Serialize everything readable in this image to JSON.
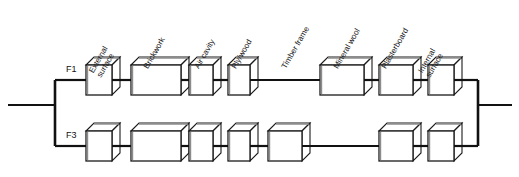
{
  "diagram": {
    "type": "thermal-resistance-network",
    "title": "",
    "background_color": "#ffffff",
    "line_color": "#111111",
    "box_face_color": "#ffffff",
    "box_edge_color": "#1a1a1a",
    "box_shade_color": "#8c8c8c",
    "layer_labels": [
      {
        "name": "external-surface",
        "text": "External\nsurface",
        "x": 103,
        "y": 62
      },
      {
        "name": "brickwork",
        "text": "Brickwork",
        "x": 150,
        "y": 62
      },
      {
        "name": "air-cavity",
        "text": "Air cavity",
        "x": 201,
        "y": 62
      },
      {
        "name": "ply-wood",
        "text": "Ply/wood",
        "x": 238,
        "y": 62
      },
      {
        "name": "timber-frame",
        "text": "Timber frame",
        "x": 288,
        "y": 62
      },
      {
        "name": "mineral-wool",
        "text": "Mineral wool",
        "x": 340,
        "y": 62
      },
      {
        "name": "plasterboard",
        "text": "Plasterboard",
        "x": 388,
        "y": 62
      },
      {
        "name": "internal-surface",
        "text": "Internal\nsurface",
        "x": 432,
        "y": 62
      }
    ],
    "paths": [
      {
        "id": "F1",
        "label": "F1",
        "label_x": 66,
        "label_y": 64,
        "wire_y": 80,
        "elements": [
          {
            "kind": "box",
            "layer": "external-surface",
            "x": 86,
            "w": 26
          },
          {
            "kind": "box",
            "layer": "brickwork",
            "x": 131,
            "w": 50
          },
          {
            "kind": "box",
            "layer": "air-cavity",
            "x": 189,
            "w": 24
          },
          {
            "kind": "box",
            "layer": "ply-wood",
            "x": 228,
            "w": 22
          },
          {
            "kind": "wire",
            "layer": "timber-frame",
            "x": 250,
            "w": 70
          },
          {
            "kind": "box",
            "layer": "mineral-wool",
            "x": 320,
            "w": 44
          },
          {
            "kind": "box",
            "layer": "plasterboard",
            "x": 379,
            "w": 34
          },
          {
            "kind": "box",
            "layer": "internal-surface",
            "x": 428,
            "w": 26
          }
        ]
      },
      {
        "id": "F3",
        "label": "F3",
        "label_x": 66,
        "label_y": 130,
        "wire_y": 146,
        "elements": [
          {
            "kind": "box",
            "layer": "external-surface",
            "x": 86,
            "w": 26
          },
          {
            "kind": "box",
            "layer": "brickwork",
            "x": 131,
            "w": 50
          },
          {
            "kind": "box",
            "layer": "air-cavity",
            "x": 189,
            "w": 24
          },
          {
            "kind": "box",
            "layer": "ply-wood",
            "x": 228,
            "w": 22
          },
          {
            "kind": "box",
            "layer": "timber-frame",
            "x": 268,
            "w": 34
          },
          {
            "kind": "wire",
            "layer": "mineral-wool",
            "x": 302,
            "w": 75
          },
          {
            "kind": "box",
            "layer": "plasterboard",
            "x": 379,
            "w": 34
          },
          {
            "kind": "box",
            "layer": "internal-surface",
            "x": 428,
            "w": 26
          }
        ]
      }
    ],
    "bus": {
      "left_x": 55,
      "right_x": 478,
      "lead_y": 105,
      "lead_in_start_x": 8,
      "lead_out_end_x": 512
    },
    "box_geometry": {
      "height": 30,
      "depth_x": 8,
      "depth_y": 8
    }
  }
}
